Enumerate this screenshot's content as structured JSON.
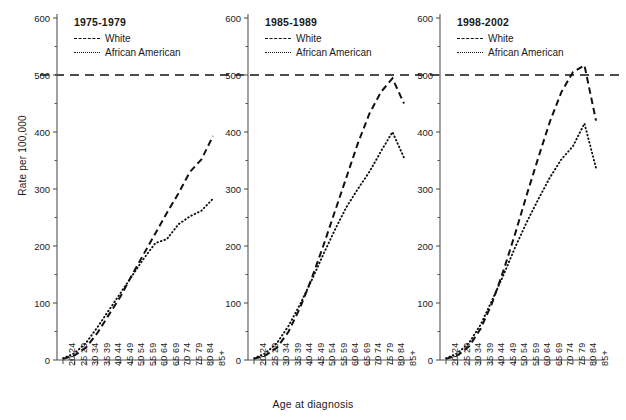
{
  "chart_data": {
    "type": "line",
    "title": "",
    "xlabel": "Age at diagnosis",
    "ylabel": "Rate per 100,000",
    "ylim": [
      0,
      600
    ],
    "yticks": [
      0,
      100,
      200,
      300,
      400,
      500,
      600
    ],
    "grid": false,
    "legend_position": "top-left inside each panel",
    "reference_line": {
      "value": 500,
      "style": "dashed",
      "spans_all_panels": true
    },
    "categories": [
      "20 24",
      "25 29",
      "30 34",
      "35 39",
      "40 44",
      "45 49",
      "50 54",
      "55 59",
      "60 64",
      "65 69",
      "70 74",
      "75 79",
      "80 84",
      "85+"
    ],
    "panels": [
      {
        "title": "1975-1979",
        "series": [
          {
            "name": "White",
            "style": "dashed",
            "values": [
              2,
              8,
              22,
              48,
              80,
              112,
              150,
              186,
              222,
              258,
              292,
              330,
              352,
              393
            ]
          },
          {
            "name": "African American",
            "style": "dotted",
            "values": [
              3,
              12,
              30,
              58,
              88,
              118,
              148,
              178,
              205,
              212,
              238,
              252,
              262,
              283
            ]
          }
        ]
      },
      {
        "title": "1985-1989",
        "series": [
          {
            "name": "White",
            "style": "dashed",
            "values": [
              2,
              8,
              22,
              50,
              92,
              143,
              200,
              260,
              320,
              380,
              432,
              470,
              494,
              450
            ]
          },
          {
            "name": "African American",
            "style": "dotted",
            "values": [
              3,
              12,
              30,
              60,
              98,
              140,
              185,
              228,
              268,
              300,
              330,
              366,
              400,
              355
            ]
          }
        ]
      },
      {
        "title": "1998-2002",
        "series": [
          {
            "name": "White",
            "style": "dashed",
            "values": [
              2,
              8,
              24,
              55,
              100,
              158,
              222,
              290,
              355,
              418,
              470,
              505,
              517,
              420
            ]
          },
          {
            "name": "African American",
            "style": "dotted",
            "values": [
              3,
              12,
              30,
              62,
              105,
              150,
              198,
              242,
              282,
              320,
              352,
              375,
              415,
              337
            ]
          }
        ]
      }
    ],
    "legend": [
      {
        "label": "White",
        "style": "dashed"
      },
      {
        "label": "African American",
        "style": "dotted"
      }
    ]
  },
  "axis": {
    "y_title": "Rate per 100,000",
    "x_title": "Age at diagnosis",
    "y_tick_labels": [
      "0",
      "100",
      "200",
      "300",
      "400",
      "500",
      "600"
    ],
    "x_tick_labels": [
      "20 24",
      "25 29",
      "30 34",
      "35 39",
      "40 44",
      "45 49",
      "50 54",
      "55 59",
      "60 64",
      "65 69",
      "70 74",
      "75 79",
      "80 84",
      "85+"
    ]
  },
  "panel_titles": [
    "1975-1979",
    "1985-1989",
    "1998-2002"
  ],
  "legend_labels": {
    "white": "White",
    "african_american": "African American"
  },
  "colors": {
    "line": "#111111",
    "axis": "#555555",
    "text": "#1a1a1a"
  }
}
